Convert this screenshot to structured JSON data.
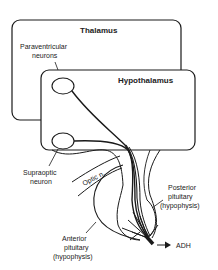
{
  "diagram": {
    "boxes": {
      "thalamus": "Thalamus",
      "hypothalamus": "Hypothalamus"
    },
    "labels": {
      "paraventricular_1": "Paraventricular",
      "paraventricular_2": "neurons",
      "supraoptic_1": "Supraoptic",
      "supraoptic_2": "neuron",
      "optic": "Optic n.",
      "posterior_1": "Posterior",
      "posterior_2": "pituitary",
      "posterior_3": "(hypophysis)",
      "anterior_1": "Anterior",
      "anterior_2": "pituitary",
      "anterior_3": "(hypophysis)",
      "adh": "ADH"
    },
    "colors": {
      "line": "#1a1a1a",
      "text": "#222222",
      "background": "#ffffff"
    }
  }
}
